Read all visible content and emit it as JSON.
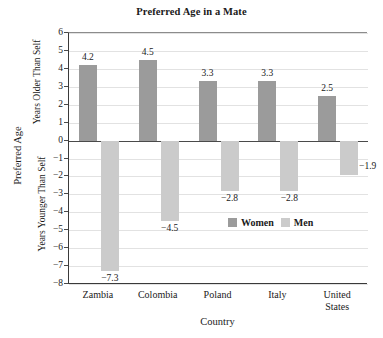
{
  "chart_data": {
    "type": "bar",
    "title": "Preferred Age in a Mate",
    "xlabel": "Country",
    "ylabel": "Preferred Age",
    "ylabel_upper": "Years Older Than Self",
    "ylabel_lower": "Years Younger Than Self",
    "categories": [
      "Zambia",
      "Colombia",
      "Poland",
      "Italy",
      "United States"
    ],
    "series": [
      {
        "name": "Women",
        "color": "#9b9b9b",
        "values": [
          4.2,
          4.5,
          3.3,
          3.3,
          2.5
        ],
        "labels": [
          "4.2",
          "4.5",
          "3.3",
          "3.3",
          "2.5"
        ]
      },
      {
        "name": "Men",
        "color": "#cbcbcb",
        "values": [
          -7.3,
          -4.5,
          -2.8,
          -2.8,
          -1.9
        ],
        "labels": [
          "−7.3",
          "−4.5",
          "−2.8",
          "−2.8",
          "−1.9"
        ]
      }
    ],
    "ylim": [
      -8,
      6
    ],
    "yticks": [
      6,
      5,
      4,
      3,
      2,
      1,
      0,
      -1,
      -2,
      -3,
      -4,
      -5,
      -6,
      -7,
      -8
    ],
    "ytick_labels": [
      "6",
      "5",
      "4",
      "3",
      "2",
      "1",
      "0",
      "−1",
      "−2",
      "−3",
      "−4",
      "−5",
      "−6",
      "−7",
      "−8"
    ],
    "grid": true,
    "legend_position": "inside-lower-right",
    "legend": [
      "Women",
      "Men"
    ]
  },
  "legend": {
    "women_label": "Women",
    "men_label": "Men"
  },
  "xticks": {
    "labels": [
      "Zambia",
      "Colombia",
      "Poland",
      "Italy",
      "United\nStates"
    ]
  }
}
